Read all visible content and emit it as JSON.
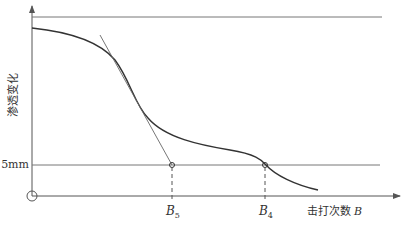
{
  "diagram": {
    "y_axis_label": "渗透变化",
    "x_axis_label": "击打次数",
    "x_axis_var": "B",
    "reference_line_label": "5mm",
    "points": [
      {
        "name": "B",
        "sub": "5"
      },
      {
        "name": "B",
        "sub": "4"
      }
    ],
    "origin_symbol": "circle",
    "colors": {
      "curve": "#333333",
      "axis": "#555555",
      "guide": "#777777",
      "text": "#333333"
    }
  }
}
